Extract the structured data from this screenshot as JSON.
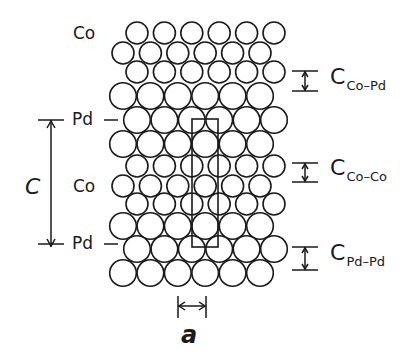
{
  "diagram": {
    "type": "crystal-structure-cross-section",
    "lattice": {
      "column_spacing": 27.4,
      "rows": [
        {
          "layer": "Co",
          "size": "small",
          "y": 33,
          "x0": 137,
          "count": 6
        },
        {
          "layer": "Co",
          "size": "small",
          "y": 53,
          "x0": 123,
          "count": 6
        },
        {
          "layer": "Co",
          "size": "small",
          "y": 72,
          "x0": 137,
          "count": 6
        },
        {
          "layer": "Pd",
          "size": "large",
          "y": 96,
          "x0": 123,
          "count": 6
        },
        {
          "layer": "Pd",
          "size": "large",
          "y": 120,
          "x0": 137,
          "count": 6
        },
        {
          "layer": "Pd",
          "size": "large",
          "y": 144,
          "x0": 123,
          "count": 6
        },
        {
          "layer": "Co",
          "size": "small",
          "y": 166,
          "x0": 137,
          "count": 6
        },
        {
          "layer": "Co",
          "size": "small",
          "y": 186,
          "x0": 123,
          "count": 6
        },
        {
          "layer": "Co",
          "size": "small",
          "y": 204,
          "x0": 137,
          "count": 6
        },
        {
          "layer": "Pd",
          "size": "large",
          "y": 226,
          "x0": 123,
          "count": 6
        },
        {
          "layer": "Pd",
          "size": "large",
          "y": 249,
          "x0": 137,
          "count": 6
        },
        {
          "layer": "Pd",
          "size": "large",
          "y": 273,
          "x0": 123,
          "count": 6
        }
      ],
      "radius": {
        "small": 11,
        "large": 13.3
      }
    },
    "unit_cell": {
      "x": 192,
      "y": 119,
      "width": 26,
      "height": 128
    },
    "left_labels": [
      {
        "text": "Co",
        "x": 73,
        "y": 25
      },
      {
        "text": "Pd",
        "x": 72,
        "y": 111,
        "tick": true
      },
      {
        "text": "Co",
        "x": 73,
        "y": 178
      },
      {
        "text": "Pd",
        "x": 72,
        "y": 235,
        "tick": true
      }
    ],
    "c_dimension": {
      "label": "C",
      "x_line": 51,
      "y_top": 120,
      "y_bottom": 247,
      "label_x": 25,
      "label_y": 176
    },
    "a_dimension": {
      "label": "a",
      "x_left": 178,
      "x_right": 206,
      "y": 306,
      "label_x": 181,
      "label_y": 323
    },
    "right_dimensions": [
      {
        "main": "C",
        "sub": "Co–Pd",
        "y_top": 71,
        "y_bottom": 91,
        "label_y": 66
      },
      {
        "main": "C",
        "sub": "Co–Co",
        "y_top": 163,
        "y_bottom": 182,
        "label_y": 157
      },
      {
        "main": "C",
        "sub": "Pd–Pd",
        "y_top": 247,
        "y_bottom": 270,
        "label_y": 242
      }
    ],
    "colors": {
      "ink": "#1a1a1a",
      "background": "#ffffff"
    }
  }
}
